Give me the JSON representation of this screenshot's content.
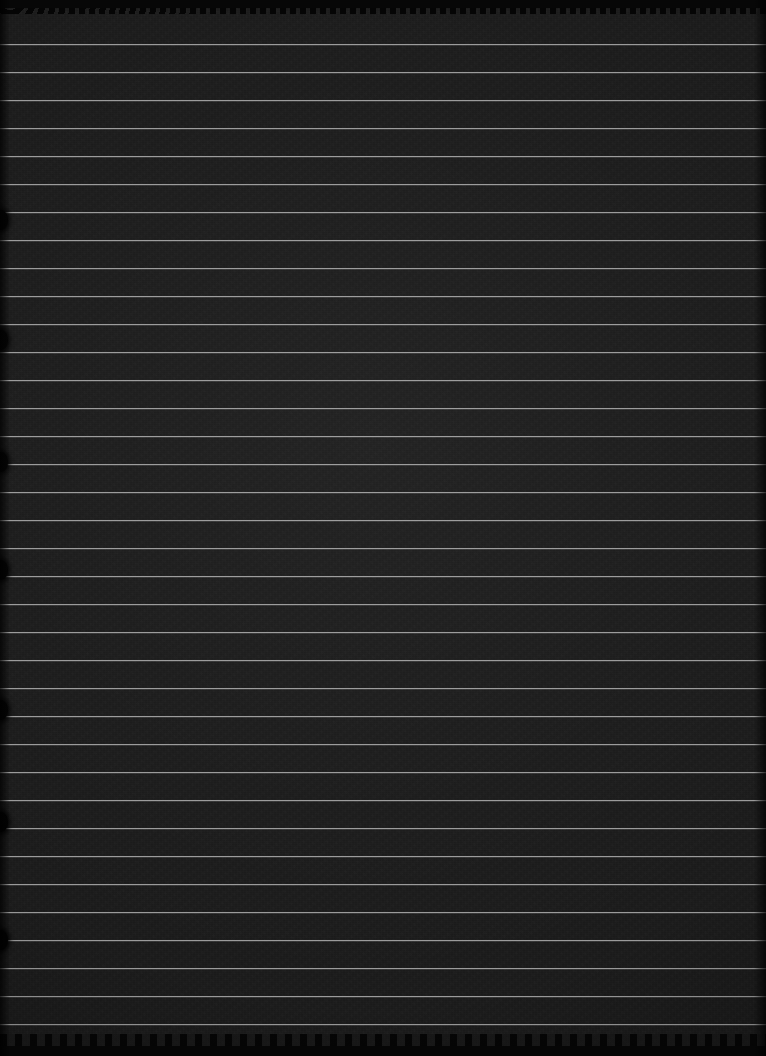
{
  "image": {
    "kind": "photograph",
    "subject": "ruled-notepad-paper",
    "description": "Severely underexposed photograph of a sheet of ruled notepad paper",
    "width": 766,
    "height": 1056,
    "orientation": "portrait",
    "legible_text": "",
    "exposure": "very dark / near black"
  },
  "colors": {
    "background": "#1b1b1b",
    "rule_line": "#a6a6a6",
    "edge_shadow": "#050505",
    "notch": "#030303",
    "page_frame": "#000000"
  },
  "paper": {
    "rule_color": "#a6a6a6",
    "rule_thickness_px": 1,
    "rule_spacing_px": 28,
    "first_rule_y": 44,
    "rule_count": 36,
    "rules_y": [
      44,
      72,
      100,
      128,
      156,
      184,
      212,
      240,
      268,
      296,
      324,
      352,
      380,
      408,
      436,
      464,
      492,
      520,
      548,
      576,
      604,
      632,
      660,
      688,
      716,
      744,
      772,
      800,
      828,
      856,
      884,
      912,
      940,
      968,
      996,
      1024
    ],
    "top_edge": "torn-scalloped",
    "bottom_edge": "torn-scalloped",
    "texture": "paper-grain"
  },
  "binding": {
    "side": "left",
    "notch_count": 7,
    "notches_y": [
      210,
      330,
      452,
      560,
      700,
      812,
      930
    ]
  },
  "content": {
    "has_handwriting": false,
    "has_printed_text": false,
    "visible_text_items": []
  }
}
